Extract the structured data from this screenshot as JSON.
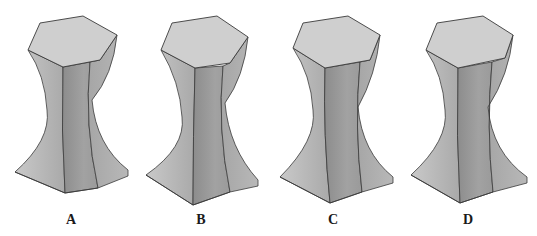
{
  "figure": {
    "background": "#ffffff",
    "colors": {
      "top": "#cfcfcf",
      "left_face": "#bdbdbd",
      "front_face": "#9a9a9a",
      "right_face": "#b0b0b0",
      "edge": "#3a3a3a"
    },
    "options": [
      {
        "label": "A",
        "label_x": 71,
        "hex": [
          [
            40,
            23
          ],
          [
            83,
            16
          ],
          [
            117,
            35
          ],
          [
            100,
            60
          ],
          [
            63,
            67
          ],
          [
            28,
            50
          ]
        ],
        "waist_left": [
          47,
          110
        ],
        "waist_right": [
          92,
          100
        ],
        "base_left": [
          15,
          172
        ],
        "base_front": [
          65,
          193
        ],
        "base_right": [
          128,
          170
        ],
        "inner_top": [
          90,
          62
        ],
        "inner_bottom": [
          98,
          188
        ]
      },
      {
        "label": "B",
        "label_x": 201,
        "hex": [
          [
            172,
            23
          ],
          [
            217,
            16
          ],
          [
            248,
            37
          ],
          [
            230,
            63
          ],
          [
            195,
            68
          ],
          [
            161,
            50
          ]
        ],
        "waist_left": [
          182,
          117
        ],
        "waist_right": [
          225,
          103
        ],
        "base_left": [
          146,
          175
        ],
        "base_front": [
          193,
          205
        ],
        "base_right": [
          258,
          180
        ],
        "inner_top": [
          223,
          66
        ],
        "inner_bottom": [
          230,
          192
        ]
      },
      {
        "label": "C",
        "label_x": 333,
        "hex": [
          [
            303,
            23
          ],
          [
            348,
            16
          ],
          [
            380,
            35
          ],
          [
            370,
            60
          ],
          [
            325,
            68
          ],
          [
            293,
            48
          ]
        ],
        "waist_left": [
          313,
          110
        ],
        "waist_right": [
          358,
          107
        ],
        "base_left": [
          280,
          177
        ],
        "base_front": [
          330,
          203
        ],
        "base_right": [
          393,
          177
        ],
        "inner_top": [
          360,
          62
        ],
        "inner_bottom": [
          362,
          192
        ]
      },
      {
        "label": "D",
        "label_x": 468,
        "hex": [
          [
            437,
            23
          ],
          [
            483,
            16
          ],
          [
            513,
            35
          ],
          [
            505,
            58
          ],
          [
            458,
            68
          ],
          [
            426,
            50
          ]
        ],
        "waist_left": [
          445,
          110
        ],
        "waist_right": [
          488,
          107
        ],
        "base_left": [
          411,
          175
        ],
        "base_front": [
          460,
          203
        ],
        "base_right": [
          527,
          177
        ],
        "inner_top": [
          492,
          62
        ],
        "inner_bottom": [
          493,
          192
        ]
      }
    ]
  }
}
